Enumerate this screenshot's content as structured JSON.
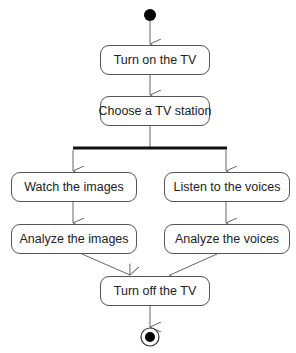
{
  "diagram": {
    "type": "uml-activity",
    "colors": {
      "line": "#666666",
      "border": "#555555",
      "fill": "#000000",
      "text": "#222222"
    },
    "start": {
      "cx": 150,
      "cy": 15,
      "r": 6
    },
    "end": {
      "cx": 150,
      "cy": 337,
      "outer_r": 9,
      "inner_r": 5
    },
    "fork_bar": {
      "x1": 73,
      "x2": 226,
      "y": 148
    },
    "nodes": [
      {
        "id": "turn_on",
        "label": "Turn on the TV",
        "x": 100,
        "y": 45,
        "w": 110,
        "h": 30
      },
      {
        "id": "choose",
        "label": "Choose a TV station",
        "x": 100,
        "y": 96,
        "w": 110,
        "h": 30
      },
      {
        "id": "watch",
        "label": "Watch the images",
        "x": 11,
        "y": 172,
        "w": 126,
        "h": 30
      },
      {
        "id": "listen",
        "label": "Listen to the voices",
        "x": 164,
        "y": 172,
        "w": 126,
        "h": 30
      },
      {
        "id": "analyze_images",
        "label": "Analyze the images",
        "x": 11,
        "y": 224,
        "w": 126,
        "h": 30
      },
      {
        "id": "analyze_voices",
        "label": "Analyze the voices",
        "x": 164,
        "y": 224,
        "w": 126,
        "h": 30
      },
      {
        "id": "turn_off",
        "label": "Turn off the TV",
        "x": 100,
        "y": 276,
        "w": 110,
        "h": 30
      }
    ],
    "edges": [
      {
        "from": "start",
        "to": "turn_on"
      },
      {
        "from": "turn_on",
        "to": "choose"
      },
      {
        "from": "choose",
        "to": "fork"
      },
      {
        "from": "fork",
        "to": "watch"
      },
      {
        "from": "fork",
        "to": "listen"
      },
      {
        "from": "watch",
        "to": "analyze_images"
      },
      {
        "from": "listen",
        "to": "analyze_voices"
      },
      {
        "from": "analyze_images",
        "to": "turn_off"
      },
      {
        "from": "analyze_voices",
        "to": "turn_off"
      },
      {
        "from": "turn_off",
        "to": "end"
      }
    ]
  }
}
